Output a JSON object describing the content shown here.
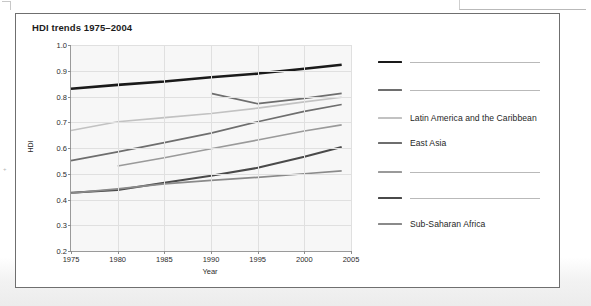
{
  "figure": {
    "title": "HDI trends 1975–2004"
  },
  "chart_data": {
    "type": "line",
    "title": "HDI trends 1975–2004",
    "xlabel": "Year",
    "ylabel": "HDI",
    "xlim": [
      1975,
      2005
    ],
    "ylim": [
      0.2,
      1.0
    ],
    "xticks": [
      1975,
      1980,
      1985,
      1990,
      1995,
      2000,
      2005
    ],
    "yticks": [
      0.2,
      0.3,
      0.4,
      0.5,
      0.6,
      0.7,
      0.8,
      0.9,
      1.0
    ],
    "grid": true,
    "legend_position": "right",
    "series": [
      {
        "name": "",
        "label_blank": true,
        "color": "#1a1a1a",
        "width": 2.6,
        "x": [
          1975,
          1980,
          1985,
          1990,
          1995,
          2000,
          2004
        ],
        "y": [
          0.83,
          0.845,
          0.858,
          0.875,
          0.889,
          0.908,
          0.923
        ]
      },
      {
        "name": "",
        "label_blank": true,
        "color": "#6e6e6e",
        "width": 1.7,
        "x": [
          1990,
          1995,
          2000,
          2004
        ],
        "y": [
          0.812,
          0.772,
          0.793,
          0.812
        ]
      },
      {
        "name": "Latin America and the Caribbean",
        "label_blank": false,
        "color": "#c2c2c2",
        "width": 1.7,
        "x": [
          1975,
          1980,
          1985,
          1990,
          1995,
          2000,
          2004
        ],
        "y": [
          0.668,
          0.702,
          0.718,
          0.734,
          0.755,
          0.779,
          0.797
        ]
      },
      {
        "name": "East Asia",
        "label_blank": false,
        "color": "#6e6e6e",
        "width": 1.7,
        "x": [
          1975,
          1980,
          1985,
          1990,
          1995,
          2000,
          2004
        ],
        "y": [
          0.551,
          0.585,
          0.621,
          0.658,
          0.702,
          0.742,
          0.769
        ]
      },
      {
        "name": "",
        "label_blank": true,
        "color": "#9a9a9a",
        "width": 1.7,
        "x": [
          1980,
          1985,
          1990,
          1995,
          2000,
          2004
        ],
        "y": [
          0.53,
          0.562,
          0.597,
          0.631,
          0.666,
          0.69
        ]
      },
      {
        "name": "",
        "label_blank": true,
        "color": "#4a4a4a",
        "width": 2.0,
        "x": [
          1975,
          1980,
          1985,
          1990,
          1995,
          2000,
          2004
        ],
        "y": [
          0.426,
          0.437,
          0.465,
          0.492,
          0.523,
          0.566,
          0.604
        ]
      },
      {
        "name": "Sub-Saharan Africa",
        "label_blank": false,
        "color": "#8a8a8a",
        "width": 1.7,
        "x": [
          1975,
          1980,
          1985,
          1990,
          1995,
          2000,
          2004
        ],
        "y": [
          0.425,
          0.441,
          0.461,
          0.474,
          0.486,
          0.5,
          0.511
        ]
      }
    ]
  },
  "legend": {
    "entries": [
      {
        "label": "",
        "blank": true,
        "color": "#1a1a1a",
        "width": 2.8
      },
      {
        "label": "",
        "blank": true,
        "color": "#6e6e6e",
        "width": 2.4
      },
      {
        "label": "Latin America and the Caribbean",
        "blank": false,
        "color": "#c2c2c2",
        "width": 2.2
      },
      {
        "label": "East Asia",
        "blank": false,
        "color": "#6e6e6e",
        "width": 2.2
      },
      {
        "label": "",
        "blank": true,
        "color": "#9a9a9a",
        "width": 2.4
      },
      {
        "label": "",
        "blank": true,
        "color": "#4a4a4a",
        "width": 2.8
      },
      {
        "label": "Sub-Saharan Africa",
        "blank": false,
        "color": "#8a8a8a",
        "width": 2.2
      }
    ]
  }
}
